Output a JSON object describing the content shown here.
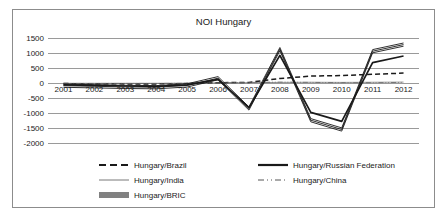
{
  "chart_data": {
    "type": "line",
    "title": "NOI Hungary",
    "xlabel": "",
    "ylabel": "",
    "x": [
      "2001",
      "2002",
      "2003",
      "2004",
      "2005",
      "2006",
      "2007",
      "2008",
      "2009",
      "2010",
      "2011",
      "2012"
    ],
    "categories": [
      "2001",
      "2002",
      "2003",
      "2004",
      "2005",
      "2006",
      "2007",
      "2008",
      "2009",
      "2010",
      "2011",
      "2012"
    ],
    "ylim": [
      -2000,
      1500
    ],
    "yticks": [
      "1500",
      "1000",
      "500",
      "0",
      "-500",
      "-1000",
      "-1500",
      "-2000"
    ],
    "ytick_values": [
      1500,
      1000,
      500,
      0,
      -500,
      -1000,
      -1500,
      -2000
    ],
    "grid": true,
    "legend_position": "bottom",
    "series": [
      {
        "name": "Hungary/Brazil",
        "style": "dashed",
        "values": [
          -20,
          -25,
          -30,
          -30,
          -20,
          10,
          20,
          150,
          230,
          250,
          290,
          330
        ]
      },
      {
        "name": "Hungary/India",
        "style": "thin-solid",
        "values": [
          -10,
          -10,
          -10,
          -10,
          -5,
          5,
          10,
          20,
          25,
          20,
          25,
          30
        ]
      },
      {
        "name": "Hungary/China",
        "style": "dash-dot-dot",
        "values": [
          -15,
          -15,
          -15,
          -15,
          -10,
          0,
          20,
          30,
          20,
          10,
          10,
          20
        ]
      },
      {
        "name": "Hungary/Russian Federation",
        "style": "thick-solid",
        "values": [
          -60,
          -80,
          -100,
          -110,
          -60,
          120,
          -820,
          920,
          -980,
          -1280,
          680,
          900
        ]
      },
      {
        "name": "Hungary/BRIC",
        "style": "thick-double",
        "values": [
          -90,
          -110,
          -130,
          -140,
          -80,
          160,
          -850,
          1130,
          -1240,
          -1550,
          1060,
          1280
        ]
      }
    ]
  },
  "legend": {
    "items": [
      {
        "label": "Hungary/Brazil",
        "style": "dashed"
      },
      {
        "label": "Hungary/India",
        "style": "thin-solid"
      },
      {
        "label": "Hungary/BRIC",
        "style": "thick-double"
      },
      {
        "label": "Hungary/Russian Federation",
        "style": "thick-solid"
      },
      {
        "label": "Hungary/China",
        "style": "dash-dot-dot"
      }
    ]
  },
  "colors": {
    "line": "#1a1a1a",
    "grid": "#9a9a9a",
    "border": "#8c8c8c",
    "text": "#1a1a1a",
    "background": "#ffffff"
  }
}
